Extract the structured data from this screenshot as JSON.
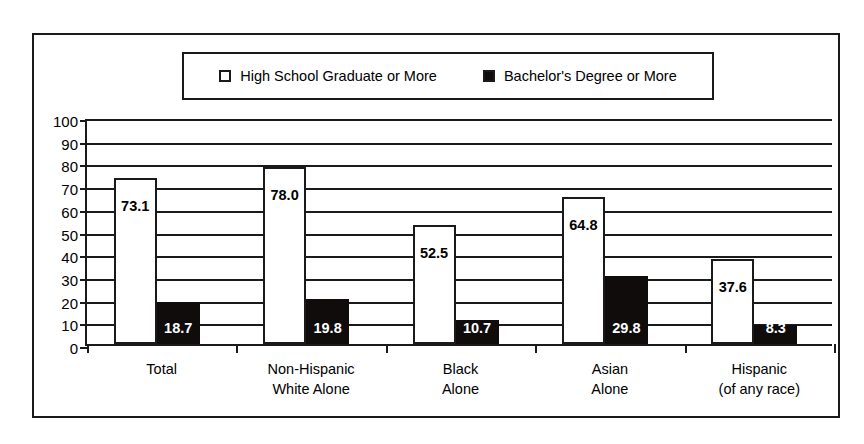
{
  "chart_data": {
    "type": "bar",
    "title": "",
    "xlabel": "",
    "ylabel": "",
    "ylim": [
      0,
      100
    ],
    "yticks": [
      0,
      10,
      20,
      30,
      40,
      50,
      60,
      70,
      80,
      90,
      100
    ],
    "grid": true,
    "legend_position": "top-center",
    "categories": [
      "Total",
      "Non-Hispanic\nWhite Alone",
      "Black\nAlone",
      "Asian\nAlone",
      "Hispanic\n(of any race)"
    ],
    "category_lines": [
      [
        "Total"
      ],
      [
        "Non-Hispanic",
        "White Alone"
      ],
      [
        "Black",
        "Alone"
      ],
      [
        "Asian",
        "Alone"
      ],
      [
        "Hispanic",
        "(of any race)"
      ]
    ],
    "series": [
      {
        "name": "High School Graduate or More",
        "color": "#ffffff",
        "edge_color": "#1a1a1a",
        "values": [
          73.1,
          78.0,
          52.5,
          64.8,
          37.6
        ],
        "labels": [
          "73.1",
          "78.0",
          "52.5",
          "64.8",
          "37.6"
        ]
      },
      {
        "name": "Bachelor's Degree or More",
        "color": "#100c0c",
        "edge_color": "#100c0c",
        "values": [
          18.7,
          19.8,
          10.7,
          29.8,
          8.3
        ],
        "labels": [
          "18.7",
          "19.8",
          "10.7",
          "29.8",
          "8.3"
        ]
      }
    ]
  },
  "legend": {
    "entries": [
      {
        "label": "High School Graduate or More",
        "swatch": "hollow"
      },
      {
        "label": "Bachelor's Degree or More",
        "swatch": "filled"
      }
    ]
  },
  "axis": {
    "y_tick_labels": [
      "100",
      "90",
      "80",
      "70",
      "60",
      "50",
      "40",
      "30",
      "20",
      "10",
      "0"
    ]
  }
}
